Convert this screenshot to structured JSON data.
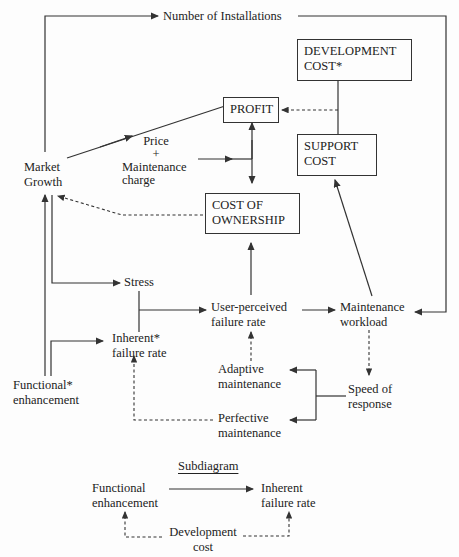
{
  "nodes": {
    "installations": "Number of Installations",
    "development_cost": [
      "DEVELOPMENT",
      "COST*"
    ],
    "profit": "PROFIT",
    "price": [
      "Price",
      "+",
      "Maintenance",
      "charge"
    ],
    "support_cost": [
      "SUPPORT",
      "COST"
    ],
    "market_growth": [
      "Market",
      "Growth"
    ],
    "cost_of_ownership": [
      "COST OF",
      "OWNERSHIP"
    ],
    "stress": "Stress",
    "user_failure": [
      "User-perceived",
      "failure rate"
    ],
    "maintenance_workload": [
      "Maintenance",
      "workload"
    ],
    "inherent_failure": [
      "Inherent*",
      "failure rate"
    ],
    "adaptive": [
      "Adaptive",
      "maintenance"
    ],
    "speed": [
      "Speed of",
      "response"
    ],
    "functional": [
      "Functional*",
      "enhancement"
    ],
    "perfective": [
      "Perfective",
      "maintenance"
    ]
  },
  "subdiagram": {
    "title": "Subdiagram",
    "functional": [
      "Functional",
      "enhancement"
    ],
    "inherent": [
      "Inherent",
      "failure rate"
    ],
    "development": [
      "Development",
      "cost"
    ]
  }
}
